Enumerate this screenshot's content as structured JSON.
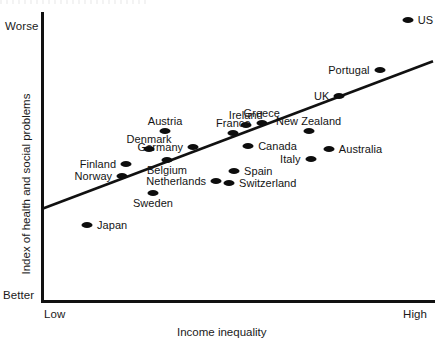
{
  "chart_data": {
    "type": "scatter",
    "title": "",
    "xlabel": "Income inequality",
    "ylabel": "Index of health and social problems",
    "x_tick_labels": [
      "Low",
      "High"
    ],
    "y_tick_labels": [
      "Better",
      "Worse"
    ],
    "grid": false,
    "legend": "none",
    "axis_color": "#111111",
    "point_color": "#0d0d0d",
    "trend_line_color": "#111111",
    "xlim": [
      0,
      100
    ],
    "ylim": [
      0,
      100
    ],
    "trend_line": {
      "x0": 0.0,
      "y0": 32.0,
      "x1": 100.0,
      "y1": 83.5
    },
    "points": [
      {
        "label": "US",
        "x": 93.5,
        "y": 98.0,
        "label_pos": "right"
      },
      {
        "label": "Portugal",
        "x": 86.3,
        "y": 80.5,
        "label_pos": "left"
      },
      {
        "label": "UK",
        "x": 76.0,
        "y": 71.5,
        "label_pos": "left"
      },
      {
        "label": "Greece",
        "x": 56.1,
        "y": 62.0,
        "label_pos": "above"
      },
      {
        "label": "Ireland",
        "x": 52.0,
        "y": 61.3,
        "label_pos": "above"
      },
      {
        "label": "New Zealand",
        "x": 68.1,
        "y": 59.0,
        "label_pos": "above"
      },
      {
        "label": "France",
        "x": 48.8,
        "y": 58.3,
        "label_pos": "above"
      },
      {
        "label": "Austria",
        "x": 31.3,
        "y": 59.0,
        "label_pos": "above"
      },
      {
        "label": "Australia",
        "x": 73.3,
        "y": 52.8,
        "label_pos": "right"
      },
      {
        "label": "Canada",
        "x": 52.6,
        "y": 53.8,
        "label_pos": "right"
      },
      {
        "label": "Italy",
        "x": 68.6,
        "y": 49.3,
        "label_pos": "left"
      },
      {
        "label": "Germany",
        "x": 38.5,
        "y": 53.5,
        "label_pos": "left"
      },
      {
        "label": "Denmark",
        "x": 27.2,
        "y": 52.8,
        "label_pos": "above"
      },
      {
        "label": "Belgium",
        "x": 31.8,
        "y": 49.0,
        "label_pos": "below"
      },
      {
        "label": "Finland",
        "x": 21.3,
        "y": 47.5,
        "label_pos": "left"
      },
      {
        "label": "Spain",
        "x": 49.0,
        "y": 45.0,
        "label_pos": "right"
      },
      {
        "label": "Norway",
        "x": 20.3,
        "y": 43.3,
        "label_pos": "left"
      },
      {
        "label": "Netherlands",
        "x": 44.4,
        "y": 41.5,
        "label_pos": "left"
      },
      {
        "label": "Switzerland",
        "x": 47.7,
        "y": 41.0,
        "label_pos": "right"
      },
      {
        "label": "Sweden",
        "x": 28.2,
        "y": 37.3,
        "label_pos": "below"
      },
      {
        "label": "Japan",
        "x": 11.3,
        "y": 26.3,
        "label_pos": "right"
      }
    ]
  }
}
